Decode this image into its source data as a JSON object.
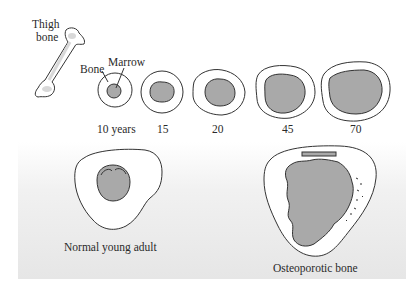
{
  "figure": {
    "top_row": {
      "thigh_bone_label": [
        "Thigh",
        "bone"
      ],
      "bone_label": "Bone",
      "marrow_label": "Marrow",
      "age_labels": [
        "10 years",
        "15",
        "20",
        "45",
        "70"
      ]
    },
    "bottom_row": {
      "left_caption": "Normal young adult",
      "right_caption": "Osteoporotic bone"
    },
    "colors": {
      "bone_fill": "#ffffff",
      "marrow_fill": "#a9a9a9",
      "outline": "#333333",
      "panel_gradient_top": "#ffffff",
      "panel_gradient_bottom": "#e6e6e6"
    }
  }
}
